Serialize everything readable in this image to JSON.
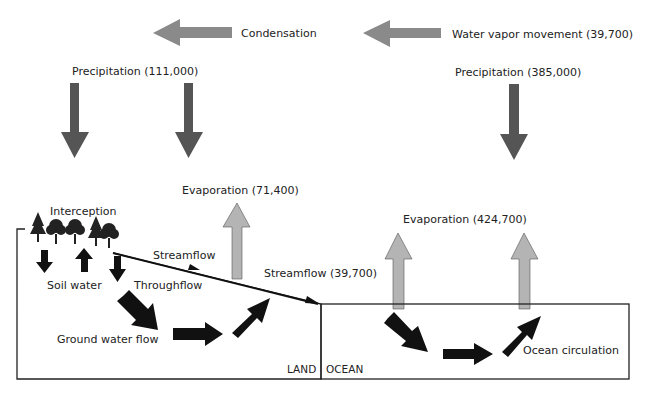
{
  "colors": {
    "horizontal_arrow": "#8a8a8a",
    "precipitation_arrow": "#555555",
    "evaporation_arrow": "#b4b4b4",
    "flow_arrow": "#111111",
    "outline": "#222222"
  },
  "atmosphere": {
    "condensation": "Condensation",
    "water_vapor": "Water vapor movement (39,700)",
    "precip_land": "Precipitation (111,000)",
    "precip_ocean": "Precipitation (385,000)",
    "evap_land": "Evaporation (71,400)",
    "evap_ocean": "Evaporation (424,700)"
  },
  "land": {
    "interception": "Interception",
    "soil_water": "Soil water",
    "streamflow": "Streamflow",
    "throughflow": "Throughflow",
    "streamflow_total": "Streamflow (39,700)",
    "ground_water_flow": "Ground water flow",
    "region_label": "LAND"
  },
  "ocean": {
    "ocean_circulation": "Ocean circulation",
    "region_label": "OCEAN"
  }
}
